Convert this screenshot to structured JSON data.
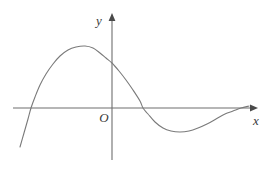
{
  "figure": {
    "background_color": "#ffffff",
    "width": 274,
    "height": 169
  },
  "axes": {
    "x_axis": {
      "label": "x",
      "color": "#6e6e6e",
      "arrow": "right-arrowhead",
      "start_px": 13,
      "end_px": 258,
      "y_px": 108
    },
    "y_axis": {
      "label": "y",
      "color": "#6e6e6e",
      "arrow": "up-arrowhead",
      "start_px": 160,
      "end_px": 14,
      "x_px": 112
    },
    "origin": {
      "label": "O",
      "x_px": 112,
      "y_px": 108
    }
  },
  "chart_data": {
    "type": "line",
    "title": "",
    "xlabel": "x",
    "ylabel": "y",
    "grid": false,
    "legend": null,
    "axis_origin_px": {
      "x": 112,
      "y": 108
    },
    "curve": {
      "name": "f(x)",
      "color": "#7a7a7a",
      "stroke_width": 1.1,
      "description": "Curve enters from lower left, rises steeply crossing the x-axis, reaches a local maximum above the axis left of the y-axis, descends crossing the y-axis at a positive value, crosses the x-axis again, dips to a local minimum below the axis, then rises and flattens approaching the x-axis from below on the right.",
      "features": {
        "left_endpoint_px": {
          "x": 20,
          "y": 147
        },
        "first_x_intercept_px": {
          "x": 31,
          "y": 108
        },
        "local_maximum_px": {
          "x": 85,
          "y": 46
        },
        "y_intercept_px": {
          "x": 112,
          "y": 63
        },
        "second_x_intercept_px": {
          "x": 143,
          "y": 108
        },
        "local_minimum_px": {
          "x": 180,
          "y": 132
        },
        "right_endpoint_px": {
          "x": 249,
          "y": 106
        }
      },
      "path_points_px": [
        [
          20,
          147
        ],
        [
          24,
          133
        ],
        [
          28,
          119
        ],
        [
          31,
          108
        ],
        [
          35,
          97
        ],
        [
          40,
          85
        ],
        [
          46,
          74
        ],
        [
          53,
          64
        ],
        [
          60,
          56
        ],
        [
          68,
          50
        ],
        [
          76,
          47
        ],
        [
          85,
          46
        ],
        [
          93,
          48
        ],
        [
          100,
          53
        ],
        [
          106,
          58
        ],
        [
          112,
          63
        ],
        [
          119,
          71
        ],
        [
          126,
          80
        ],
        [
          133,
          90
        ],
        [
          140,
          101
        ],
        [
          143,
          108
        ],
        [
          148,
          114
        ],
        [
          155,
          122
        ],
        [
          163,
          128
        ],
        [
          171,
          131
        ],
        [
          180,
          132
        ],
        [
          189,
          131
        ],
        [
          198,
          128
        ],
        [
          207,
          124
        ],
        [
          216,
          119
        ],
        [
          225,
          114
        ],
        [
          233,
          111
        ],
        [
          241,
          108
        ],
        [
          249,
          106
        ]
      ]
    }
  }
}
